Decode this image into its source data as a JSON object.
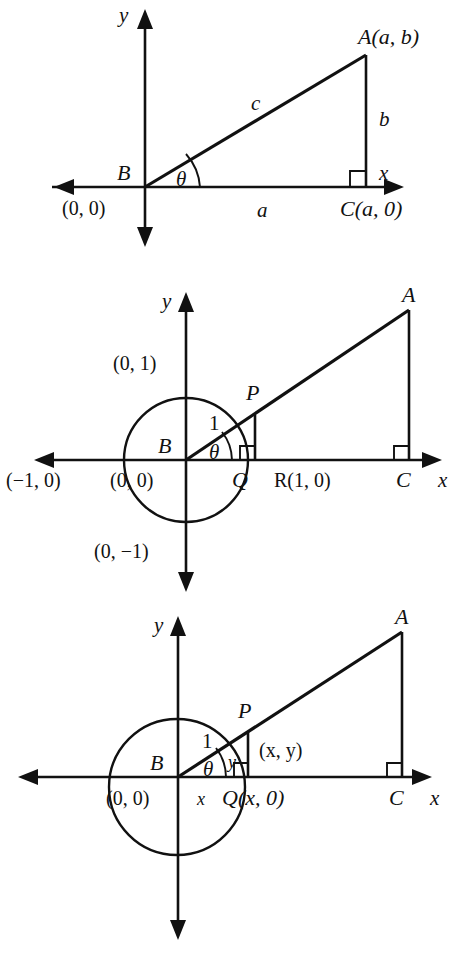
{
  "document": {
    "kind": "math-figure-sheet",
    "figure_count": 3,
    "ink_color": "#111111",
    "background_color": "#ffffff"
  },
  "figures": [
    {
      "id": "figure-1",
      "caption_topic": "right triangle ABC on coordinate axes with legs a and b and hypotenuse c",
      "axes": {
        "x_label": "x",
        "y_label": "y"
      },
      "labels": {
        "vertex_b": "B",
        "origin_coord": "(0, 0)",
        "vertex_a": "A(a, b)",
        "vertex_c": "C(a, 0)",
        "side_a": "a",
        "side_b": "b",
        "side_c": "c",
        "angle": "θ"
      }
    },
    {
      "id": "figure-2",
      "caption_topic": "unit circle centered at B with point P on circle, foot Q, and similar right triangle ABC",
      "axes": {
        "x_label": "x",
        "y_label": "y"
      },
      "labels": {
        "vertex_b": "B",
        "origin_coord": "(0, 0)",
        "circle_top": "(0, 1)",
        "circle_bottom": "(0, −1)",
        "circle_left": "(−1, 0)",
        "circle_right": "R(1, 0)",
        "point_p": "P",
        "point_q": "Q",
        "vertex_a": "A",
        "vertex_c": "C",
        "radius": "1",
        "angle": "θ"
      }
    },
    {
      "id": "figure-3",
      "caption_topic": "unit circle with P at (x, y), foot Q at (x, 0), legs x and y, and similar right triangle ABC",
      "axes": {
        "x_label": "x",
        "y_label": "y"
      },
      "labels": {
        "vertex_b": "B",
        "origin_coord": "(0, 0)",
        "point_p": "P",
        "point_p_coord": "(x, y)",
        "point_q": "Q(x, 0)",
        "vertex_a": "A",
        "vertex_c": "C",
        "radius": "1",
        "leg_x": "x",
        "leg_y": "y",
        "angle": "θ"
      }
    }
  ]
}
